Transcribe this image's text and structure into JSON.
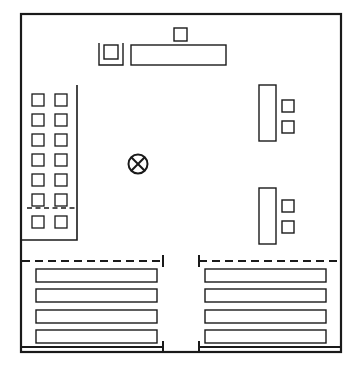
{
  "diagram": {
    "type": "schematic-floor-plan",
    "canvas": {
      "width": 359,
      "height": 367
    },
    "colors": {
      "stroke": "#1a1a1a",
      "fill": "#ffffff",
      "background": "#ffffff"
    },
    "frame": {
      "name": "outer-boundary",
      "x": 21,
      "y": 14,
      "width": 320,
      "height": 338
    },
    "top_group": {
      "name": "top-equipment-row",
      "small_square": {
        "x": 174,
        "y": 28,
        "size": 13
      },
      "bracketed_square": {
        "bracket": {
          "x": 99,
          "y": 43,
          "width": 24,
          "height": 22
        },
        "square": {
          "x": 104,
          "y": 45,
          "size": 14
        }
      },
      "long_bar": {
        "x": 131,
        "y": 45,
        "width": 95,
        "height": 20
      }
    },
    "left_grid": {
      "name": "left-module-array",
      "container": {
        "x": 21,
        "y": 85,
        "width": 56,
        "height": 155
      },
      "rows": 7,
      "columns": 2,
      "cell_size": 12,
      "col_x": [
        32,
        55
      ],
      "row_y": [
        94,
        114,
        134,
        154,
        174,
        194,
        216
      ],
      "dashed_separator": {
        "y": 208,
        "x1": 27,
        "x2": 75,
        "after_row": 6
      }
    },
    "center_symbol": {
      "name": "center-cross-circle",
      "cx": 138,
      "cy": 164,
      "r": 9.5
    },
    "right_groups": [
      {
        "name": "upper-right-unit",
        "tall_bar": {
          "x": 259,
          "y": 85,
          "width": 17,
          "height": 56
        },
        "squares": [
          {
            "x": 282,
            "y": 100,
            "size": 12
          },
          {
            "x": 282,
            "y": 121,
            "size": 12
          }
        ]
      },
      {
        "name": "lower-right-unit",
        "tall_bar": {
          "x": 259,
          "y": 188,
          "width": 17,
          "height": 56
        },
        "squares": [
          {
            "x": 282,
            "y": 200,
            "size": 12
          },
          {
            "x": 282,
            "y": 221,
            "size": 12
          }
        ]
      }
    ],
    "bottom_left_bay": {
      "name": "bottom-left-rack-bay",
      "dashed_dim": {
        "y": 261,
        "x1": 22,
        "x2": 163
      },
      "dim_tick_right": {
        "x": 163,
        "y1": 255,
        "y2": 267
      },
      "bottom_dim": {
        "y": 347,
        "x1": 22,
        "x2": 163
      },
      "bottom_tick_right": {
        "x": 163,
        "y1": 341,
        "y2": 353
      },
      "bars": [
        {
          "x": 36,
          "y": 269,
          "width": 121,
          "height": 13
        },
        {
          "x": 36,
          "y": 289,
          "width": 121,
          "height": 13
        },
        {
          "x": 36,
          "y": 310,
          "width": 121,
          "height": 13
        },
        {
          "x": 36,
          "y": 330,
          "width": 121,
          "height": 13
        }
      ]
    },
    "bottom_right_bay": {
      "name": "bottom-right-rack-bay",
      "dashed_dim": {
        "y": 261,
        "x1": 199,
        "x2": 340
      },
      "dim_tick_left": {
        "x": 199,
        "y1": 255,
        "y2": 267
      },
      "bottom_dim": {
        "y": 347,
        "x1": 199,
        "x2": 340
      },
      "bottom_tick_left": {
        "x": 199,
        "y1": 341,
        "y2": 353
      },
      "bars": [
        {
          "x": 205,
          "y": 269,
          "width": 121,
          "height": 13
        },
        {
          "x": 205,
          "y": 289,
          "width": 121,
          "height": 13
        },
        {
          "x": 205,
          "y": 310,
          "width": 121,
          "height": 13
        },
        {
          "x": 205,
          "y": 330,
          "width": 121,
          "height": 13
        }
      ]
    }
  }
}
